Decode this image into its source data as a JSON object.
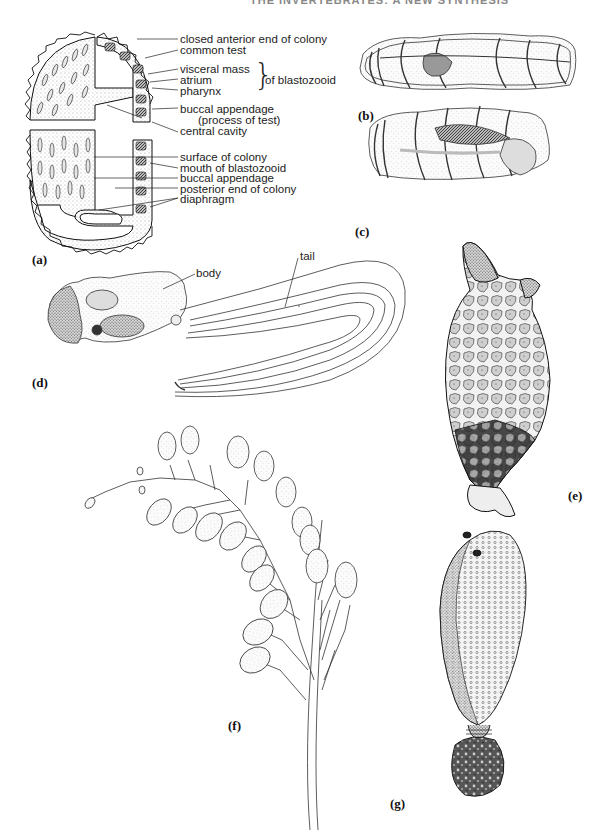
{
  "page": {
    "running_head": "THE INVERTEBRATES: A NEW SYNTHESIS"
  },
  "figure": {
    "panels": [
      {
        "id": "a",
        "label": "(a)"
      },
      {
        "id": "b",
        "label": "(b)"
      },
      {
        "id": "c",
        "label": "(c)"
      },
      {
        "id": "d",
        "label": "(d)"
      },
      {
        "id": "e",
        "label": "(e)"
      },
      {
        "id": "f",
        "label": "(f)"
      },
      {
        "id": "g",
        "label": "(g)"
      }
    ],
    "panel_a": {
      "labels": [
        "closed anterior end of colony",
        "common test",
        "visceral mass",
        "atrium",
        "pharynx",
        "buccal appendage",
        "(process of test)",
        "central cavity",
        "surface of colony",
        "mouth of blastozooid",
        "buccal appendage",
        "posterior end of colony",
        "diaphragm"
      ],
      "group_label": "of blastozooid"
    },
    "panel_d": {
      "labels": [
        "body",
        "tail"
      ]
    }
  }
}
